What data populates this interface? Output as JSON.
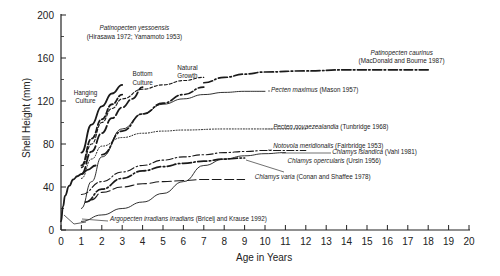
{
  "chart_data": {
    "type": "line",
    "title": "",
    "xlabel": "Age in Years",
    "ylabel": "Shell Height (mm)",
    "xlim": [
      0,
      20
    ],
    "ylim": [
      0,
      200
    ],
    "xticks": [
      0,
      1,
      2,
      3,
      4,
      5,
      6,
      7,
      8,
      9,
      10,
      11,
      12,
      13,
      14,
      15,
      16,
      17,
      18,
      19,
      20
    ],
    "yticks": [
      0,
      40,
      80,
      120,
      160,
      200
    ],
    "grid": false,
    "legend_position": "inline annotations",
    "series": [
      {
        "name": "Patinopecten yessoensis - Hanging Culture",
        "style": "solid-bold",
        "x": [
          1,
          1.5,
          2,
          2.5,
          3
        ],
        "y": [
          72,
          98,
          115,
          127,
          135
        ]
      },
      {
        "name": "Patinopecten yessoensis - Hanging Culture (2)",
        "style": "dash-bold",
        "x": [
          1,
          1.5,
          2,
          2.5,
          3
        ],
        "y": [
          60,
          85,
          103,
          117,
          126
        ]
      },
      {
        "name": "Patinopecten yessoensis - Bottom Culture",
        "style": "dashed",
        "x": [
          1,
          1.5,
          2,
          2.5,
          3,
          4,
          5,
          6,
          7
        ],
        "y": [
          58,
          80,
          100,
          113,
          122,
          131,
          135,
          139,
          142
        ]
      },
      {
        "name": "Patinopecten yessoensis - Bottom Culture (2)",
        "style": "long-dash-bold",
        "x": [
          1,
          1.5,
          2,
          2.5,
          3,
          3.5,
          4
        ],
        "y": [
          52,
          73,
          90,
          104,
          114,
          122,
          133
        ]
      },
      {
        "name": "Patinopecten yessoensis - Natural Growth",
        "style": "dash-dot-bold",
        "x": [
          2,
          3,
          4,
          5,
          6,
          7
        ],
        "y": [
          70,
          92,
          108,
          118,
          126,
          133
        ]
      },
      {
        "name": "Patinopecten caurinus (MacDonald and Bourne 1987)",
        "style": "dash-dot-bold",
        "x": [
          7,
          8,
          9,
          10,
          12,
          14,
          16,
          18
        ],
        "y": [
          137,
          142,
          145,
          147,
          148,
          149,
          149,
          149
        ]
      },
      {
        "name": "Pecten maximus (Mason 1957)",
        "style": "solid-thin",
        "x": [
          1,
          1.5,
          2,
          3,
          4,
          5,
          6,
          7,
          8,
          9,
          10
        ],
        "y": [
          20,
          45,
          68,
          94,
          108,
          117,
          122,
          126,
          128,
          129,
          129
        ]
      },
      {
        "name": "Pecten novaezealandia (Tunbridge 1968)",
        "style": "dotted",
        "x": [
          1,
          1.5,
          2,
          3,
          4,
          5,
          6,
          8,
          10,
          12
        ],
        "y": [
          48,
          66,
          78,
          86,
          90,
          92,
          93,
          94,
          94,
          94
        ]
      },
      {
        "name": "Notovola meridionalis (Fairbridge 1953)",
        "style": "dash-dot",
        "x": [
          1,
          2,
          3,
          4,
          5,
          6,
          7,
          8,
          9,
          10,
          12
        ],
        "y": [
          33,
          45,
          54,
          60,
          65,
          68,
          70,
          72,
          73,
          74,
          74
        ]
      },
      {
        "name": "Chlamys opercularis (Ursin 1956)",
        "style": "dash-dot-bold",
        "x": [
          1.2,
          2,
          3,
          4,
          5,
          6,
          7,
          8,
          9
        ],
        "y": [
          26,
          38,
          48,
          55,
          59,
          62,
          64,
          66,
          67
        ]
      },
      {
        "name": "Chlamys varia (Conan and Shaffee 1978)",
        "style": "long-dash",
        "x": [
          1.5,
          2,
          3,
          4,
          5,
          6,
          7,
          8,
          9
        ],
        "y": [
          28,
          35,
          40,
          43,
          45,
          46,
          47,
          47,
          47
        ]
      },
      {
        "name": "Chlamys islandica (Vahl 1981)",
        "style": "solid-thin",
        "x": [
          1,
          2,
          3,
          4,
          5,
          6,
          7,
          8,
          9,
          10,
          11
        ],
        "y": [
          8,
          14,
          20,
          26,
          34,
          45,
          60,
          66,
          69,
          71,
          72
        ]
      },
      {
        "name": "Argopecten irradians irradians (Bricelj and Krause 1992)",
        "style": "solid-bold",
        "x": [
          0,
          0.1,
          0.2,
          0.4,
          0.6,
          0.8,
          1,
          1.3,
          1.7
        ],
        "y": [
          8,
          22,
          32,
          41,
          47,
          50,
          52,
          56,
          60
        ]
      }
    ],
    "annotations": [
      {
        "text": "Patinopecten yessoensis",
        "italic": true,
        "x": 3.6,
        "y": 186
      },
      {
        "text": "(Hirasawa 1972; Yamamoto 1953)",
        "italic": false,
        "x": 3.6,
        "y": 178
      },
      {
        "text": "Hanging",
        "x": 1.2,
        "y": 126
      },
      {
        "text": "Culture",
        "x": 1.2,
        "y": 118
      },
      {
        "text": "Bottom",
        "x": 4.0,
        "y": 143
      },
      {
        "text": "Culture",
        "x": 4.0,
        "y": 135
      },
      {
        "text": "Natural",
        "x": 6.2,
        "y": 149
      },
      {
        "text": "Growth",
        "x": 6.2,
        "y": 141
      },
      {
        "text": "Patinopecten caurinus",
        "italic": true,
        "x": 16.7,
        "y": 163
      },
      {
        "text": "(MacDonald and Bourne 1987)",
        "x": 16.7,
        "y": 155
      },
      {
        "text": "Pecten maximus",
        "italic": true,
        "suffix": " (Mason 1957)",
        "x": 10.3,
        "y": 128
      },
      {
        "text": "Pecten novaezealandia",
        "italic": true,
        "suffix": " (Tunbridge 1968)",
        "x": 10.4,
        "y": 94
      },
      {
        "text": "Notovola meridionalis",
        "italic": true,
        "suffix": " (Fairbridge  1953)",
        "x": 10.4,
        "y": 76
      },
      {
        "text": "Chlamys islandica",
        "italic": true,
        "suffix": " (Vahl 1981)",
        "x": 13.3,
        "y": 71
      },
      {
        "text": "Chlamys opercularis",
        "italic": true,
        "suffix": " (Ursin 1956)",
        "x": 11.1,
        "y": 62
      },
      {
        "text": "Chlamys varia",
        "italic": true,
        "suffix": " (Conan and Shaffee 1978)",
        "x": 9.5,
        "y": 47
      },
      {
        "text": "Argopecten irradians irradians",
        "italic": true,
        "suffix": "  (Bricelj and Krause 1992)",
        "x": 2.4,
        "y": 8
      }
    ]
  },
  "axes": {
    "xlabel": "Age in Years",
    "ylabel": "Shell Height (mm)"
  }
}
